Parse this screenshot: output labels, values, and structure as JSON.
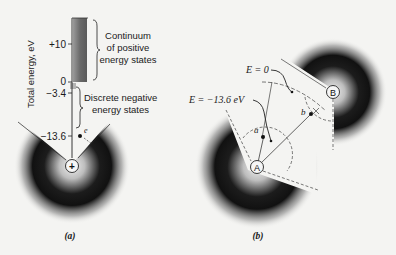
{
  "panel_a": {
    "caption": "(a)",
    "y_axis_label": "Total energy, eV",
    "ticks": [
      {
        "label": "+10",
        "y": 44
      },
      {
        "label": "0",
        "y": 82
      },
      {
        "label": "−3.4",
        "y": 93
      },
      {
        "label": "−13.6",
        "y": 136
      }
    ],
    "continuum_label_lines": [
      "Continuum",
      "of positive",
      "energy states"
    ],
    "discrete_label_lines": [
      "Discrete negative",
      "energy states"
    ],
    "electron_label": "e",
    "nucleus_symbol": "+"
  },
  "panel_b": {
    "caption": "(b)",
    "label_e_zero": "E = 0",
    "label_e_bound": "E = −13.6 eV",
    "nucleus_a_label": "A",
    "nucleus_b_label": "B",
    "point_a_label": "a",
    "point_b_label": "b"
  },
  "colors": {
    "background": "#f4f4f2",
    "ink": "#1a1a1a",
    "continuum_bar": "#6a6a6a",
    "cloud_dark": "#111111"
  }
}
